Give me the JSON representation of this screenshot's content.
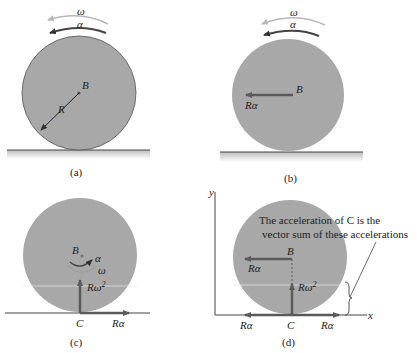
{
  "colors": {
    "disk_fill": "#a8a8a8",
    "disk_stroke": "#555555",
    "arrow": "#5a5a5a",
    "ground_fill": "#cfcfcf",
    "omega_arrow": "#b8b8b8",
    "alpha_arrow": "#555555"
  },
  "panels": {
    "a": {
      "caption": "(a)",
      "omega": "ω",
      "alpha": "α",
      "center_label": "B",
      "radius_label": "R"
    },
    "b": {
      "caption": "(b)",
      "omega": "ω",
      "alpha": "α",
      "center_label": "B",
      "accel_label": "Rα"
    },
    "c": {
      "caption": "(c)",
      "center_label": "B",
      "alpha": "α",
      "omega": "ω",
      "contact_label": "C",
      "normal_accel_label": "Rω",
      "normal_accel_sup": "2",
      "tangent_accel_label": "Rα"
    },
    "d": {
      "caption": "(d)",
      "axis_y": "y",
      "axis_x": "x",
      "note_line1": "The acceleration of C is the",
      "note_line2": "vector sum of these accelerations",
      "center_label": "B",
      "center_accel_label": "Rα",
      "normal_accel_label": "Rω",
      "normal_accel_sup": "2",
      "contact_label": "C",
      "bottom_left_label": "Rα",
      "bottom_right_label": "Rα"
    }
  }
}
